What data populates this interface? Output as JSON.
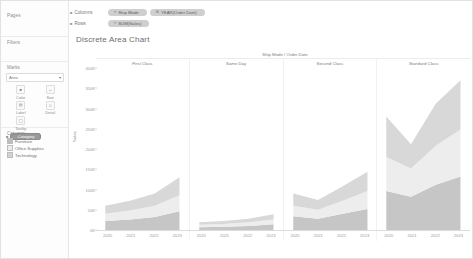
{
  "sidebar": {
    "pages": {
      "title": "Pages"
    },
    "filters": {
      "title": "Filters"
    },
    "marks": {
      "title": "Marks",
      "mark_type": "Area",
      "caret": "▾",
      "buttons": [
        {
          "name": "color",
          "label": "Color",
          "glyph": "■"
        },
        {
          "name": "size",
          "label": "Size",
          "glyph": "↔"
        },
        {
          "name": "label",
          "label": "Label",
          "glyph": "▤"
        },
        {
          "name": "detail",
          "label": "Detail",
          "glyph": "△"
        },
        {
          "name": "tooltip",
          "label": "Tooltip",
          "glyph": "◯"
        }
      ],
      "encoding_pill": {
        "icon": "■",
        "label": "Category"
      }
    },
    "legend": {
      "title": "Category",
      "items": [
        {
          "label": "Furniture",
          "color": "#bdbdbd"
        },
        {
          "label": "Office Supplies",
          "color": "#e8e8e8"
        },
        {
          "label": "Technology",
          "color": "#d2d2d2"
        }
      ]
    }
  },
  "shelves": {
    "columns": {
      "label": "Columns",
      "bullet": "■",
      "pills": [
        {
          "icon": "≡",
          "label": "Ship Mode"
        },
        {
          "icon": "⊞",
          "label": "YEAR(Order Date)"
        }
      ]
    },
    "rows": {
      "label": "Rows",
      "bullet": "■",
      "pills": [
        {
          "icon": "≡",
          "label": "SUM(Sales)"
        }
      ]
    }
  },
  "worksheet": {
    "title": "Discrete Area Chart",
    "column_field_label": "Ship Mode / Order Date"
  },
  "chart_data": {
    "type": "area",
    "stacked": true,
    "title": "Discrete Area Chart",
    "xlabel": "Ship Mode / Order Date",
    "ylabel": "Sales",
    "grid": false,
    "legend_position": "left-sidebar",
    "ylim": [
      0,
      400
    ],
    "yticks": [
      0,
      50,
      100,
      150,
      200,
      250,
      300,
      350,
      400
    ],
    "ytick_labels": [
      "0K",
      "50K",
      "100K",
      "150K",
      "200K",
      "250K",
      "300K",
      "350K",
      "400K"
    ],
    "x": [
      "2020",
      "2021",
      "2022",
      "2023"
    ],
    "panels": [
      {
        "name": "First Class",
        "series": [
          {
            "name": "Furniture",
            "values": [
              22,
              26,
              32,
              46
            ]
          },
          {
            "name": "Office Supplies",
            "values": [
              18,
              22,
              28,
              40
            ]
          },
          {
            "name": "Technology",
            "values": [
              20,
              24,
              30,
              44
            ]
          }
        ]
      },
      {
        "name": "Same Day",
        "series": [
          {
            "name": "Furniture",
            "values": [
              7,
              8,
              10,
              14
            ]
          },
          {
            "name": "Office Supplies",
            "values": [
              6,
              7,
              9,
              12
            ]
          },
          {
            "name": "Technology",
            "values": [
              6,
              7,
              9,
              13
            ]
          }
        ]
      },
      {
        "name": "Second Class",
        "series": [
          {
            "name": "Furniture",
            "values": [
              34,
              28,
              40,
              52
            ]
          },
          {
            "name": "Office Supplies",
            "values": [
              26,
              22,
              32,
              44
            ]
          },
          {
            "name": "Technology",
            "values": [
              30,
              24,
              36,
              48
            ]
          }
        ]
      },
      {
        "name": "Standard Class",
        "series": [
          {
            "name": "Furniture",
            "values": [
              96,
              82,
              112,
              132
            ]
          },
          {
            "name": "Office Supplies",
            "values": [
              84,
              70,
              96,
              116
            ]
          },
          {
            "name": "Technology",
            "values": [
              100,
              60,
              104,
              122
            ]
          }
        ]
      }
    ]
  }
}
